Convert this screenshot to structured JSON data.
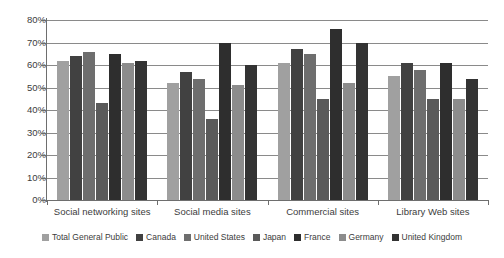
{
  "chart_data": {
    "type": "bar",
    "title": "",
    "xlabel": "",
    "ylabel": "",
    "ylim": [
      0,
      80
    ],
    "ytick_labels": [
      "80%",
      "70%",
      "60%",
      "50%",
      "40%",
      "30%",
      "20%",
      "10%",
      "0%"
    ],
    "ytick_values": [
      80,
      70,
      60,
      50,
      40,
      30,
      20,
      10,
      0
    ],
    "grid": true,
    "legend_position": "bottom",
    "categories": [
      "Social networking sites",
      "Social media sites",
      "Commercial sites",
      "Library Web sites"
    ],
    "series": [
      {
        "name": "Total General Public",
        "color": "#a0a0a0",
        "values": [
          62,
          52,
          61,
          55
        ]
      },
      {
        "name": "Canada",
        "color": "#414141",
        "values": [
          64,
          57,
          67,
          61
        ]
      },
      {
        "name": "United States",
        "color": "#6e6e6e",
        "values": [
          66,
          54,
          65,
          58
        ]
      },
      {
        "name": "Japan",
        "color": "#5a5a5a",
        "values": [
          43,
          36,
          45,
          45
        ]
      },
      {
        "name": "France",
        "color": "#2e2e2e",
        "values": [
          65,
          70,
          76,
          61
        ]
      },
      {
        "name": "Germany",
        "color": "#8c8c8c",
        "values": [
          61,
          51,
          52,
          45
        ]
      },
      {
        "name": "United Kingdom",
        "color": "#333333",
        "values": [
          62,
          60,
          70,
          54
        ]
      }
    ]
  },
  "axis": {
    "y_max_label": "80%",
    "y_min_label": "0%"
  }
}
